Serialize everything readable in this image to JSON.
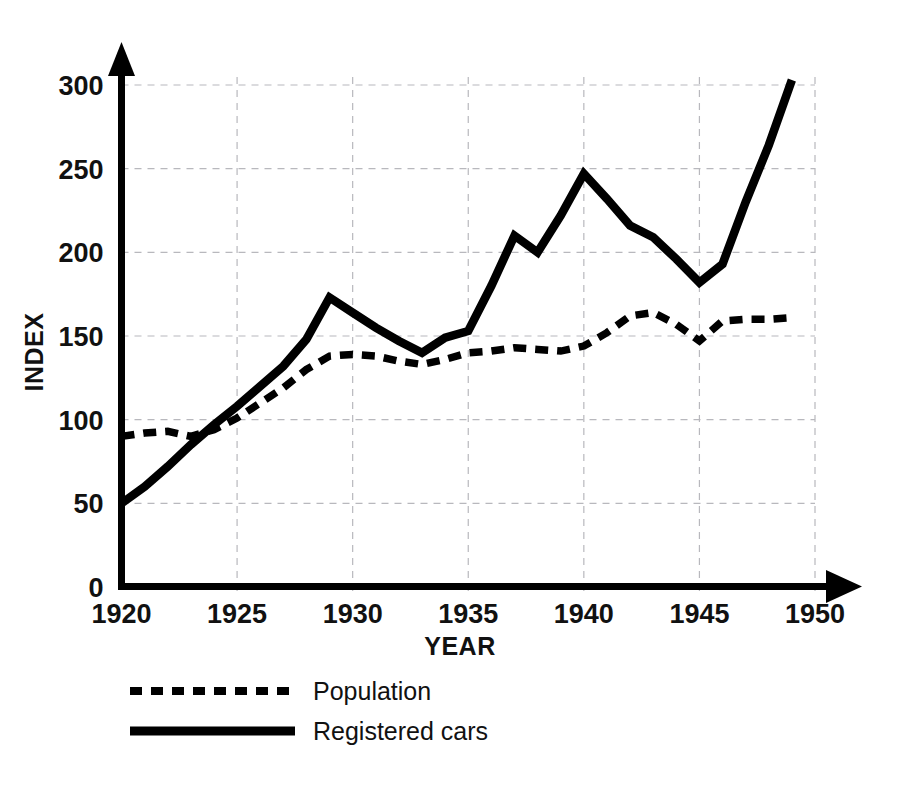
{
  "chart_data": {
    "type": "line",
    "title": "",
    "xlabel": "YEAR",
    "ylabel": "INDEX",
    "xlim": [
      1920,
      1950
    ],
    "ylim": [
      0,
      312
    ],
    "grid": true,
    "legend_position": "bottom-left",
    "x_ticks": [
      "1920",
      "1925",
      "1930",
      "1935",
      "1940",
      "1945",
      "1950"
    ],
    "x_tick_values": [
      1920,
      1925,
      1930,
      1935,
      1940,
      1945,
      1950
    ],
    "y_ticks": [
      "0",
      "50",
      "100",
      "150",
      "200",
      "250",
      "300"
    ],
    "y_tick_values": [
      0,
      50,
      100,
      150,
      200,
      250,
      300
    ],
    "x": [
      1920,
      1921,
      1922,
      1923,
      1924,
      1925,
      1926,
      1927,
      1928,
      1929,
      1930,
      1931,
      1932,
      1933,
      1934,
      1935,
      1936,
      1937,
      1938,
      1939,
      1940,
      1941,
      1942,
      1943,
      1944,
      1945,
      1946,
      1947,
      1948,
      1949
    ],
    "series": [
      {
        "name": "Population",
        "style": "dashed",
        "color": "#000000",
        "values": [
          90,
          92,
          93,
          90,
          94,
          101,
          110,
          119,
          130,
          138,
          139,
          138,
          135,
          133,
          136,
          140,
          141,
          143,
          142,
          141,
          144,
          152,
          162,
          164,
          157,
          147,
          159,
          160,
          160,
          161
        ]
      },
      {
        "name": "Registered cars",
        "style": "solid",
        "color": "#000000",
        "values": [
          50,
          60,
          72,
          85,
          97,
          108,
          120,
          132,
          148,
          173,
          164,
          155,
          147,
          140,
          149,
          153,
          180,
          210,
          200,
          222,
          247,
          232,
          216,
          209,
          196,
          182,
          193,
          230,
          264,
          303
        ]
      }
    ]
  },
  "legend": {
    "items": [
      {
        "label": "Population",
        "style": "dashed"
      },
      {
        "label": "Registered cars",
        "style": "solid"
      }
    ]
  }
}
